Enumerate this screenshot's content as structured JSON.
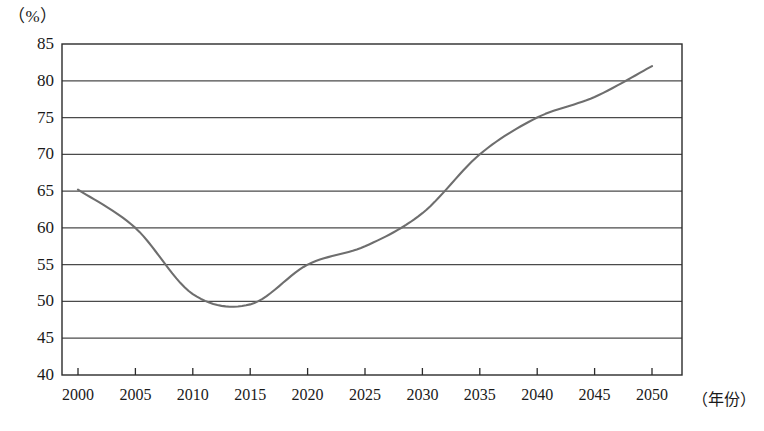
{
  "chart_data": {
    "type": "line",
    "title": "",
    "xlabel": "年份",
    "ylabel": "%",
    "unit_label": "（%）",
    "xaxis_title": "（年份）",
    "grid": true,
    "legend": "none",
    "line_color": "#6e6e6e",
    "axis_color": "#2b2b2b",
    "grid_color": "#4a4a4a",
    "xlim": [
      2000,
      2053
    ],
    "ylim": [
      40,
      85
    ],
    "ytick_step": 5,
    "yticks": [
      "85",
      "80",
      "75",
      "70",
      "65",
      "60",
      "55",
      "50",
      "45",
      "40"
    ],
    "ytick_values": [
      85,
      80,
      75,
      70,
      65,
      60,
      55,
      50,
      45,
      40
    ],
    "categories": [
      "2000",
      "2005",
      "2010",
      "2015",
      "2020",
      "2025",
      "2030",
      "2035",
      "2040",
      "2045",
      "2050"
    ],
    "x": [
      2000,
      2005,
      2010,
      2015,
      2020,
      2025,
      2030,
      2035,
      2040,
      2045,
      2050
    ],
    "values": [
      65.2,
      60.0,
      51.0,
      49.6,
      55.0,
      57.5,
      62.0,
      70.0,
      75.0,
      77.8,
      82.0
    ]
  }
}
